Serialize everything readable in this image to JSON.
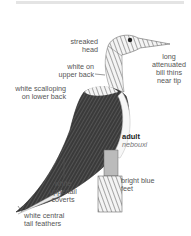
{
  "figure": {
    "age_label": "adult",
    "subspecies_label": "nebouxi"
  },
  "annotations": [
    {
      "id": "head",
      "text": "streaked head",
      "lines": [
        "streaked",
        "head"
      ]
    },
    {
      "id": "bill",
      "text": "long attenuated bill thins near tip",
      "lines": [
        "long",
        "attenuated",
        "bill thins",
        "near tip"
      ]
    },
    {
      "id": "upper-back",
      "text": "white on upper back",
      "lines": [
        "white on",
        "upper back"
      ]
    },
    {
      "id": "lower-back",
      "text": "white scalloping on lower back",
      "lines": [
        "white scalloping",
        "on lower back"
      ]
    },
    {
      "id": "feet",
      "text": "bright blue feet",
      "lines": [
        "bright blue",
        "feet"
      ]
    },
    {
      "id": "coverts",
      "text": "white uppertail coverts",
      "lines": [
        "white",
        "uppertail",
        "coverts"
      ]
    },
    {
      "id": "tail",
      "text": "white central tail feathers",
      "lines": [
        "white central",
        "tail feathers"
      ]
    }
  ],
  "colors": {
    "text": "#555555",
    "bird_dark": "#2a2a2a",
    "bird_light": "#cfcfcf"
  }
}
